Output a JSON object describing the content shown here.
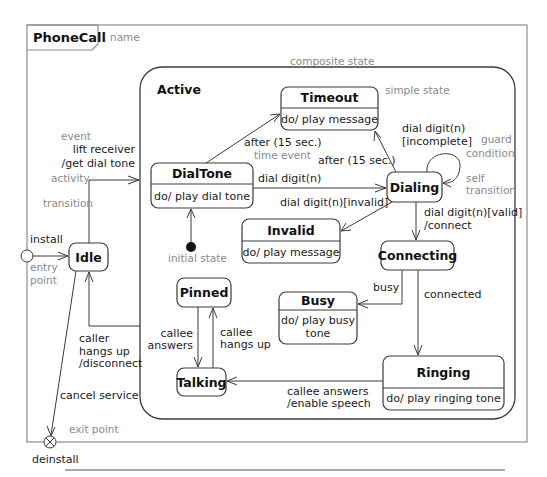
{
  "frame": {
    "title": "PhoneCall",
    "name_annotation": "name"
  },
  "composite": {
    "name": "Active",
    "annotation": "composite state"
  },
  "states": {
    "idle": {
      "name": "Idle"
    },
    "dialtone": {
      "name": "DialTone",
      "activity": "do/ play dial tone"
    },
    "timeout": {
      "name": "Timeout",
      "activity": "do/ play message",
      "annotation": "simple state"
    },
    "dialing": {
      "name": "Dialing"
    },
    "invalid": {
      "name": "Invalid",
      "activity": "do/ play message"
    },
    "connecting": {
      "name": "Connecting"
    },
    "busy": {
      "name": "Busy",
      "activity_line1": "do/ play busy",
      "activity_line2": "tone"
    },
    "pinned": {
      "name": "Pinned"
    },
    "talking": {
      "name": "Talking"
    },
    "ringing": {
      "name": "Ringing",
      "activity": "do/ play ringing tone"
    }
  },
  "pseudostates": {
    "entry": {
      "label": "install",
      "annotation_line1": "entry",
      "annotation_line2": "point"
    },
    "exit": {
      "label": "deinstall",
      "annotation": "exit point"
    },
    "initial": {
      "annotation": "initial state"
    }
  },
  "transitions": {
    "idle_to_active": {
      "line1": "lift receiver",
      "line2": "/get dial tone"
    },
    "dialtone_timeout": {
      "label": "after (15 sec.)",
      "annotation": "time event"
    },
    "dialing_timeout": {
      "label": "after (15 sec.)"
    },
    "dialtone_dialing": {
      "label": "dial digit(n)"
    },
    "dialing_invalid": {
      "label": "dial digit(n)[invalid]"
    },
    "dialing_self": {
      "line1": "dial digit(n)",
      "line2": "[incomplete]"
    },
    "dialing_connecting": {
      "line1": "dial digit(n)[valid]",
      "line2": "/connect"
    },
    "connecting_busy": {
      "label": "busy"
    },
    "connecting_ringing": {
      "label": "connected"
    },
    "ringing_talking": {
      "line1": "callee answers",
      "line2": "/enable speech"
    },
    "pinned_talking": {
      "line1": "callee",
      "line2": "answers"
    },
    "talking_pinned": {
      "line1": "callee",
      "line2": "hangs up"
    },
    "active_idle": {
      "line1": "caller",
      "line2": "hangs up",
      "line3": "/disconnect"
    },
    "idle_exit": {
      "label": "cancel service"
    }
  },
  "annotations": {
    "event": "event",
    "activity": "activity",
    "transition": "transition",
    "guard_line1": "guard",
    "guard_line2": "condition",
    "self_line1": "self",
    "self_line2": "transition"
  },
  "colors": {
    "line": "#3a3a3a",
    "annotation": "#8a8a8a",
    "frame": "#8c8c8c"
  }
}
